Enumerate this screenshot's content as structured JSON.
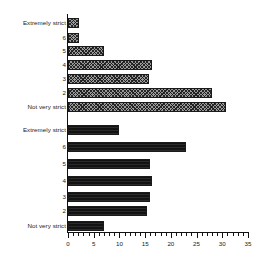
{
  "chart_data": {
    "type": "bar",
    "title": "",
    "subtitle": "",
    "xlabel": "",
    "ylabel": "",
    "orientation": "horizontal",
    "xlim": [
      0,
      35
    ],
    "xticks": [
      0,
      5,
      10,
      15,
      20,
      25,
      30,
      35
    ],
    "xtick_labels": [
      "0",
      "5",
      "10",
      "15",
      "20",
      "25",
      "30",
      "35"
    ],
    "minor_tick_step": 1,
    "grid": false,
    "legend": "none",
    "categories": [
      "Extremely strict",
      "6",
      "5",
      "4",
      "3",
      "2",
      "Not very strict"
    ],
    "series": [
      {
        "name": "group-1",
        "fill": "hatched",
        "color": "#9a9a9a",
        "values": [
          2.1,
          2.1,
          7.0,
          16.3,
          15.8,
          28.0,
          30.7
        ]
      },
      {
        "name": "group-2",
        "fill": "solid",
        "color": "#121212",
        "values": [
          9.9,
          23.0,
          15.9,
          16.3,
          15.9,
          15.4,
          7.0
        ]
      }
    ]
  },
  "axis": {
    "origin_label": "0",
    "max_label": "35"
  }
}
